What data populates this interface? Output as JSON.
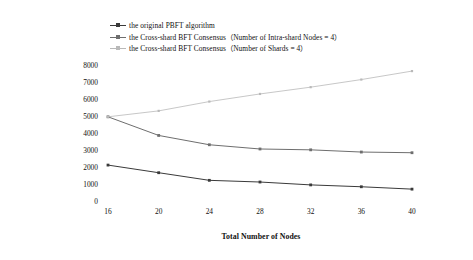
{
  "chart_data": {
    "type": "line",
    "title": "",
    "xlabel": "Total Number of Nodes",
    "ylabel": "Transaction Per Second (TPS)",
    "x": [
      16,
      20,
      24,
      28,
      32,
      36,
      40
    ],
    "xtick_labels": [
      "16",
      "20",
      "24",
      "28",
      "32",
      "36",
      "40"
    ],
    "ytick_labels": [
      "0",
      "1000",
      "2000",
      "3000",
      "4000",
      "5000",
      "6000",
      "7000",
      "8000"
    ],
    "yticks": [
      0,
      1000,
      2000,
      3000,
      4000,
      5000,
      6000,
      7000,
      8000
    ],
    "ylim": [
      0,
      8000
    ],
    "xlim": [
      16,
      40
    ],
    "grid": false,
    "legend_position": "top-left",
    "series": [
      {
        "name": "the original PBFT algorithm",
        "color": "#3a3a3a",
        "marker": "square",
        "values": [
          2150,
          1700,
          1250,
          1150,
          980,
          870,
          730
        ]
      },
      {
        "name": "the Cross-shard BFT Consensus（Number of Intra-shard Nodes = 4）",
        "color": "#6e6e6e",
        "marker": "square",
        "values": [
          5000,
          3900,
          3350,
          3100,
          3050,
          2920,
          2880
        ]
      },
      {
        "name": "the Cross-shard BFT Consensus（Number of Shards = 4）",
        "color": "#b9b9b9",
        "marker": "square",
        "values": [
          5000,
          5350,
          5900,
          6350,
          6750,
          7200,
          7700
        ]
      }
    ]
  },
  "legend": {
    "items": [
      {
        "label": "the original PBFT algorithm",
        "color": "#3a3a3a"
      },
      {
        "label": "the Cross-shard BFT Consensus（Number of Intra-shard Nodes = 4）",
        "color": "#6e6e6e"
      },
      {
        "label": "the Cross-shard BFT Consensus（Number of Shards = 4）",
        "color": "#b9b9b9"
      }
    ]
  }
}
